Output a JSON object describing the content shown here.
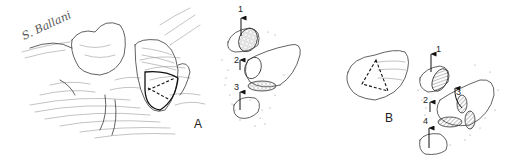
{
  "figure": {
    "signature": "S. Ballani",
    "panels": [
      {
        "label": "A",
        "arrows": [
          "1",
          "2",
          "3"
        ]
      },
      {
        "label": "B",
        "arrows": [
          "1",
          "2",
          "3",
          "4"
        ]
      }
    ]
  }
}
